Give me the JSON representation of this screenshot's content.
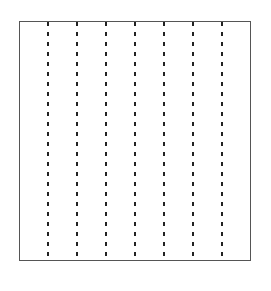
{
  "diagram": {
    "type": "rectangle-with-vertical-dashed-lines",
    "frame": {
      "x": 19,
      "y": 21,
      "width": 232,
      "height": 240,
      "stroke": "#555555"
    },
    "dashed_lines": {
      "count": 7,
      "x_positions": [
        48,
        77,
        106,
        135,
        164,
        193,
        222
      ],
      "y_top": 22,
      "y_bottom": 261,
      "stroke": "#222222",
      "dash": "4,6"
    }
  }
}
